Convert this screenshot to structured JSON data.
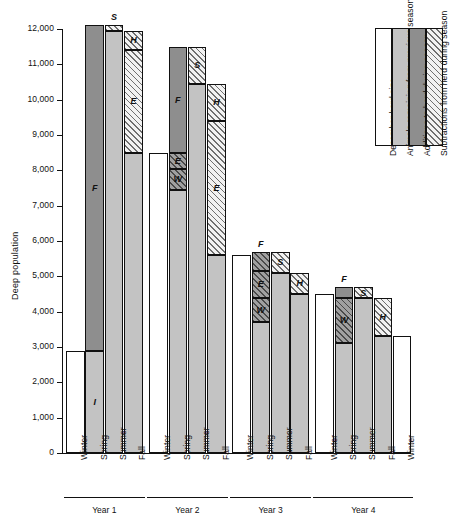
{
  "chart_data": {
    "type": "bar",
    "title": "",
    "xlabel": "",
    "ylabel": "Deep population",
    "ylim": [
      0,
      12000
    ],
    "yticks": [
      0,
      1000,
      2000,
      3000,
      4000,
      5000,
      6000,
      7000,
      8000,
      9000,
      10000,
      11000,
      12000
    ],
    "ytick_labels": [
      "0",
      "1,000",
      "2,000",
      "3,000",
      "4,000",
      "5,000",
      "6,000",
      "7,000",
      "8,000",
      "9,000",
      "10,000",
      "11,000",
      "12,000"
    ],
    "grid": false,
    "legend_position": "right",
    "groups": [
      "Year 1",
      "Year 2",
      "Year 3",
      "Year 4"
    ],
    "categories": [
      "Winter",
      "Spring",
      "Summer",
      "Fall"
    ],
    "series_styles": {
      "december_herd_size": "white",
      "remaining_from_previous_season": "light-gray",
      "additions_to_herd": "dark-gray",
      "subtractions_from_herd": "hatched"
    },
    "segment_codes": {
      "F": "Fawns",
      "S": "Summer additions",
      "H": "Hunting losses",
      "E": "Emigration / other losses",
      "W": "Winter losses",
      "I": "Increase"
    },
    "bars": [
      {
        "group": "Year 1",
        "season": "Winter",
        "style": "white",
        "base": 0,
        "top": 2900,
        "segments": [
          {
            "label": "",
            "style": "white",
            "from": 0,
            "to": 2900
          }
        ]
      },
      {
        "group": "Year 1",
        "season": "Spring",
        "style": "stacked",
        "base": 0,
        "top": 12100,
        "segments": [
          {
            "label": "I",
            "style": "light-gray",
            "from": 0,
            "to": 2900
          },
          {
            "label": "F",
            "style": "dark-gray",
            "from": 2900,
            "to": 12100
          }
        ]
      },
      {
        "group": "Year 1",
        "season": "Summer",
        "style": "stacked",
        "base": 0,
        "top": 12100,
        "segments": [
          {
            "label": "",
            "style": "light-gray",
            "from": 0,
            "to": 11950
          },
          {
            "label": "S",
            "style": "hatched",
            "from": 11950,
            "to": 12100
          }
        ]
      },
      {
        "group": "Year 1",
        "season": "Fall",
        "style": "stacked",
        "base": 0,
        "top": 11950,
        "segments": [
          {
            "label": "",
            "style": "light-gray",
            "from": 0,
            "to": 8500
          },
          {
            "label": "E",
            "style": "hatched",
            "from": 8500,
            "to": 11400
          },
          {
            "label": "H",
            "style": "hatched",
            "from": 11400,
            "to": 11950
          }
        ]
      },
      {
        "group": "Year 2",
        "season": "Winter",
        "style": "white",
        "base": 0,
        "top": 8500,
        "segments": [
          {
            "label": "",
            "style": "white",
            "from": 0,
            "to": 8500
          }
        ]
      },
      {
        "group": "Year 2",
        "season": "Spring",
        "style": "stacked",
        "base": 0,
        "top": 11500,
        "segments": [
          {
            "label": "",
            "style": "light-gray",
            "from": 0,
            "to": 7450
          },
          {
            "label": "W",
            "style": "hatched-dark",
            "from": 7450,
            "to": 8050
          },
          {
            "label": "E",
            "style": "hatched-dark",
            "from": 8050,
            "to": 8500
          },
          {
            "label": "F",
            "style": "dark-gray",
            "from": 8500,
            "to": 11500
          }
        ]
      },
      {
        "group": "Year 2",
        "season": "Summer",
        "style": "stacked",
        "base": 0,
        "top": 11500,
        "segments": [
          {
            "label": "",
            "style": "light-gray",
            "from": 0,
            "to": 10450
          },
          {
            "label": "S",
            "style": "hatched",
            "from": 10450,
            "to": 11500
          }
        ]
      },
      {
        "group": "Year 2",
        "season": "Fall",
        "style": "stacked",
        "base": 0,
        "top": 10450,
        "segments": [
          {
            "label": "",
            "style": "light-gray",
            "from": 0,
            "to": 5600
          },
          {
            "label": "E",
            "style": "hatched",
            "from": 5600,
            "to": 9400
          },
          {
            "label": "H",
            "style": "hatched",
            "from": 9400,
            "to": 10450
          }
        ]
      },
      {
        "group": "Year 3",
        "season": "Winter",
        "style": "white",
        "base": 0,
        "top": 5600,
        "segments": [
          {
            "label": "",
            "style": "white",
            "from": 0,
            "to": 5600
          }
        ]
      },
      {
        "group": "Year 3",
        "season": "Spring",
        "style": "stacked",
        "base": 0,
        "top": 5700,
        "segments": [
          {
            "label": "",
            "style": "light-gray",
            "from": 0,
            "to": 3700
          },
          {
            "label": "W",
            "style": "hatched-dark",
            "from": 3700,
            "to": 4400
          },
          {
            "label": "E",
            "style": "hatched-dark",
            "from": 4400,
            "to": 5150
          },
          {
            "label": "F",
            "style": "hatched-dark",
            "from": 5150,
            "to": 5700
          }
        ]
      },
      {
        "group": "Year 3",
        "season": "Summer",
        "style": "stacked",
        "base": 0,
        "top": 5700,
        "segments": [
          {
            "label": "",
            "style": "light-gray",
            "from": 0,
            "to": 5100
          },
          {
            "label": "S",
            "style": "hatched",
            "from": 5100,
            "to": 5700
          }
        ]
      },
      {
        "group": "Year 3",
        "season": "Fall",
        "style": "stacked",
        "base": 0,
        "top": 5100,
        "segments": [
          {
            "label": "",
            "style": "light-gray",
            "from": 0,
            "to": 4500
          },
          {
            "label": "H",
            "style": "hatched",
            "from": 4500,
            "to": 5100
          }
        ]
      },
      {
        "group": "Year 4",
        "season": "Winter",
        "style": "white",
        "base": 0,
        "top": 4500,
        "segments": [
          {
            "label": "",
            "style": "white",
            "from": 0,
            "to": 4500
          }
        ]
      },
      {
        "group": "Year 4",
        "season": "Spring",
        "style": "stacked",
        "base": 0,
        "top": 4700,
        "segments": [
          {
            "label": "",
            "style": "light-gray",
            "from": 0,
            "to": 3100
          },
          {
            "label": "W",
            "style": "hatched-dark",
            "from": 3100,
            "to": 4400
          },
          {
            "label": "F",
            "style": "dark-gray",
            "from": 4400,
            "to": 4700
          }
        ]
      },
      {
        "group": "Year 4",
        "season": "Summer",
        "style": "stacked",
        "base": 0,
        "top": 4700,
        "segments": [
          {
            "label": "",
            "style": "light-gray",
            "from": 0,
            "to": 4400
          },
          {
            "label": "S",
            "style": "hatched",
            "from": 4400,
            "to": 4700
          }
        ]
      },
      {
        "group": "Year 4",
        "season": "Fall",
        "style": "stacked",
        "base": 0,
        "top": 4400,
        "segments": [
          {
            "label": "",
            "style": "light-gray",
            "from": 0,
            "to": 3300
          },
          {
            "label": "H",
            "style": "hatched",
            "from": 3300,
            "to": 4400
          }
        ]
      },
      {
        "group": "Year 4",
        "season": "Winter",
        "style": "white",
        "base": 0,
        "top": 3300,
        "segments": [
          {
            "label": "",
            "style": "white",
            "from": 0,
            "to": 3300
          }
        ]
      }
    ],
    "legend": [
      {
        "label": "December herd size",
        "style": "white"
      },
      {
        "label": "Animals remaining from previous season",
        "style": "light-gray"
      },
      {
        "label": "Additions to herd during season",
        "style": "dark-gray"
      },
      {
        "label": "Subtractions from herd during season",
        "style": "hatched"
      }
    ]
  }
}
